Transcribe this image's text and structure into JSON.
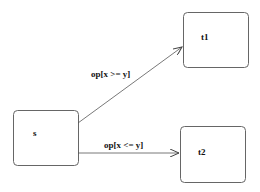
{
  "diagram": {
    "nodes": [
      {
        "id": "s",
        "label": "s"
      },
      {
        "id": "t1",
        "label": "t1"
      },
      {
        "id": "t2",
        "label": "t2"
      }
    ],
    "edges": [
      {
        "from": "s",
        "to": "t1",
        "label": "op[x >= y]"
      },
      {
        "from": "s",
        "to": "t2",
        "label": "op[x <= y]"
      }
    ],
    "colors": {
      "stroke": "#555555",
      "text": "#111111"
    }
  }
}
